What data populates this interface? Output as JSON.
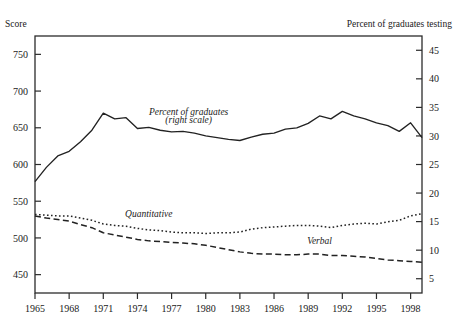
{
  "figure": {
    "cut_off_top_text": " ",
    "left_axis_label": "Score",
    "right_axis_label": "Percent of graduates testing"
  },
  "chart_data": {
    "type": "line",
    "title": "",
    "subtitle": "",
    "xlabel": "",
    "ylabel": "Score",
    "y2label": "Percent of graduates testing",
    "grid": false,
    "legend_position": "inline-annotations",
    "xlim": [
      1965,
      1999
    ],
    "ylim": [
      425,
      775
    ],
    "y2lim": [
      2.5,
      47.5
    ],
    "yticks": [
      450,
      500,
      550,
      600,
      650,
      700,
      750
    ],
    "y2ticks": [
      5,
      10,
      15,
      20,
      25,
      30,
      35,
      40,
      45
    ],
    "xticks": [
      1965,
      1968,
      1971,
      1974,
      1977,
      1980,
      1983,
      1986,
      1989,
      1992,
      1995,
      1998
    ],
    "xtick_labels": [
      "1965",
      "1968",
      "1971",
      "1974",
      "1977",
      "1980",
      "1983",
      "1986",
      "1989",
      "1992",
      "1995",
      "1998"
    ],
    "series": [
      {
        "name": "Percent of graduates",
        "annotation": "Percent of graduates",
        "annotation_line2": "(right scale)",
        "axis": "right",
        "style": "solid",
        "color": "#222222",
        "x": [
          1965,
          1966,
          1967,
          1968,
          1969,
          1970,
          1971,
          1972,
          1973,
          1974,
          1975,
          1976,
          1977,
          1978,
          1979,
          1980,
          1981,
          1982,
          1983,
          1984,
          1985,
          1986,
          1987,
          1988,
          1989,
          1990,
          1991,
          1992,
          1993,
          1994,
          1995,
          1996,
          1997,
          1998,
          1999
        ],
        "values_right_scale": [
          22.0,
          24.5,
          26.5,
          27.3,
          29.0,
          31.0,
          34.0,
          33.0,
          33.2,
          31.3,
          31.5,
          31.0,
          30.7,
          30.8,
          30.5,
          30.0,
          29.7,
          29.4,
          29.2,
          29.8,
          30.3,
          30.5,
          31.2,
          31.4,
          32.2,
          33.5,
          33.0,
          34.3,
          33.5,
          33.0,
          32.3,
          31.8,
          30.8,
          32.3,
          29.7
        ],
        "values_left_scale_equiv": [
          550,
          569,
          584,
          591,
          604,
          619,
          643,
          635,
          636,
          621,
          622,
          619,
          616,
          617,
          615,
          611,
          608,
          606,
          604,
          609,
          613,
          614,
          620,
          621,
          627,
          637,
          633,
          647,
          641,
          637,
          631,
          627,
          620,
          631,
          611
        ]
      },
      {
        "name": "Quantitative",
        "annotation": "Quantitative",
        "axis": "left",
        "style": "dotted",
        "color": "#222222",
        "x": [
          1965,
          1966,
          1967,
          1968,
          1969,
          1970,
          1971,
          1972,
          1973,
          1974,
          1975,
          1976,
          1977,
          1978,
          1979,
          1980,
          1981,
          1982,
          1983,
          1984,
          1985,
          1986,
          1987,
          1988,
          1989,
          1990,
          1991,
          1992,
          1993,
          1994,
          1995,
          1996,
          1997,
          1998,
          1999
        ],
        "values": [
          532,
          531,
          530,
          530,
          527,
          524,
          519,
          517,
          516,
          513,
          511,
          510,
          508,
          507,
          507,
          506,
          507,
          507,
          508,
          512,
          514,
          515,
          516,
          517,
          517,
          516,
          514,
          517,
          519,
          520,
          519,
          522,
          524,
          530,
          533
        ]
      },
      {
        "name": "Verbal",
        "annotation": "Verbal",
        "axis": "left",
        "style": "dashed",
        "color": "#222222",
        "x": [
          1965,
          1966,
          1967,
          1968,
          1969,
          1970,
          1971,
          1972,
          1973,
          1974,
          1975,
          1976,
          1977,
          1978,
          1979,
          1980,
          1981,
          1982,
          1983,
          1984,
          1985,
          1986,
          1987,
          1988,
          1989,
          1990,
          1991,
          1992,
          1993,
          1994,
          1995,
          1996,
          1997,
          1998,
          1999
        ],
        "values": [
          530,
          527,
          525,
          523,
          518,
          514,
          507,
          504,
          501,
          498,
          496,
          495,
          494,
          493,
          492,
          490,
          487,
          484,
          481,
          479,
          478,
          478,
          477,
          477,
          478,
          478,
          476,
          476,
          475,
          474,
          472,
          470,
          469,
          468,
          467
        ]
      }
    ],
    "annotations": [
      {
        "text": "Percent of graduates",
        "x": 1978.5,
        "y_right": 33.7,
        "style": "italic"
      },
      {
        "text": "(right scale)",
        "x": 1978.5,
        "y_right": 32.2,
        "style": "italic"
      },
      {
        "text": "Quantitative",
        "x": 1975.0,
        "y_left": 528,
        "style": "italic"
      },
      {
        "text": "Verbal",
        "x": 1990.0,
        "y_left": 492,
        "style": "italic"
      }
    ]
  }
}
